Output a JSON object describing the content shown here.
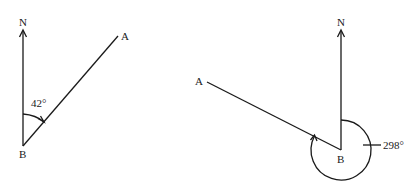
{
  "diagrams": [
    {
      "north_label": "N",
      "point_a_label": "A",
      "point_b_label": "B",
      "angle_label": "42°"
    },
    {
      "north_label": "N",
      "point_a_label": "A",
      "point_b_label": "B",
      "angle_label": "298°"
    }
  ],
  "colors": {
    "ink": "#1a1a1a",
    "background": "#ffffff"
  }
}
